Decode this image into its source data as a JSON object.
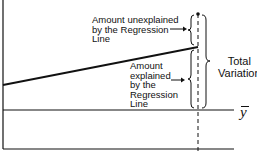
{
  "diagram": {
    "title": "",
    "labels": {
      "unexplained": "Amount unexplained\nby the Regression\nLine",
      "explained": "Amount\nexplained\nby the\nRegression\nLine",
      "total": "Total\nVariation",
      "mean_symbol": "y"
    },
    "elements": {
      "y_axis": {
        "x": 3,
        "y1": 0,
        "y2": 149
      },
      "x_axis": {
        "y": 149,
        "x1": 3,
        "x2": 234
      },
      "mean_line": {
        "y": 110,
        "x1": 3,
        "x2": 234
      },
      "regression_line": {
        "x1": 3,
        "y1": 85,
        "x2": 198,
        "y2": 47
      },
      "observation_point": {
        "x": 198,
        "y": 14
      },
      "dashed_vertical": {
        "x": 198,
        "y1": 14,
        "y2": 153
      }
    },
    "colors": {
      "ink": "#111111",
      "background": "#ffffff"
    }
  }
}
